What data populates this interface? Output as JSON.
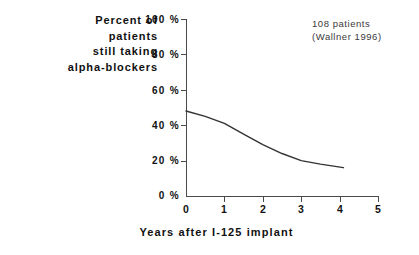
{
  "chart_data": {
    "type": "line",
    "title": "",
    "ylabel": "Percent of patients still taking alpha-blockers",
    "ylabel_lines": [
      "Percent of",
      "patients",
      "still taking",
      "alpha-blockers"
    ],
    "xlabel": "Years after I-125 implant",
    "xlim": [
      0,
      5
    ],
    "ylim": [
      0,
      100
    ],
    "grid": false,
    "legend": null,
    "x_ticks": [
      "0",
      "1",
      "2",
      "3",
      "4",
      "5"
    ],
    "x_tick_values": [
      0,
      1,
      2,
      3,
      4,
      5
    ],
    "y_ticks": [
      "0 %",
      "20 %",
      "40 %",
      "60 %",
      "80 %",
      "100 %"
    ],
    "y_tick_values": [
      0,
      20,
      40,
      60,
      80,
      100
    ],
    "annotations": [
      "108 patients",
      "(Wallner 1996)"
    ],
    "series": [
      {
        "name": "Percent still taking alpha-blockers",
        "color": "#333333",
        "x": [
          0,
          0.5,
          1,
          1.5,
          2,
          2.5,
          3,
          3.5,
          4.1
        ],
        "values": [
          48,
          45,
          41,
          35,
          29,
          24,
          20,
          18,
          16
        ]
      }
    ]
  },
  "colors": {
    "axis": "#4a4a4a",
    "curve": "#333333",
    "text": "#111111",
    "annotation_text": "#3b3b3b",
    "background": "#ffffff"
  }
}
